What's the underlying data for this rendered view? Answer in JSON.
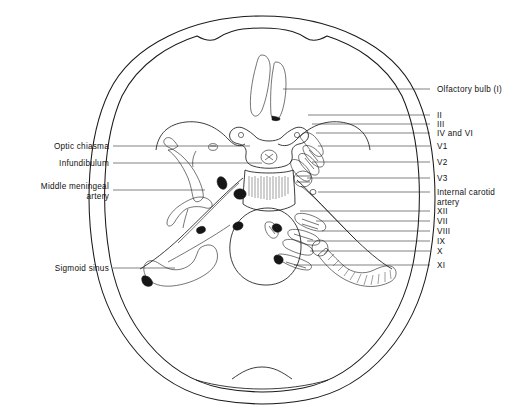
{
  "figure": {
    "view": "superior view of cranial base",
    "background_color": "#ffffff",
    "ink_color": "#1a1a1a",
    "stipple_color": "#8a8a8a"
  },
  "labels_left": [
    {
      "id": "optic-chiasma",
      "text": "Optic chiasma",
      "text2": "",
      "x": 107,
      "y": 146,
      "leader_to_x": 232,
      "leader_to_y": 146
    },
    {
      "id": "infundibulum",
      "text": "Infundibulum",
      "text2": "",
      "x": 107,
      "y": 163,
      "leader_to_x": 255,
      "leader_to_y": 163
    },
    {
      "id": "middle-meningeal-artery",
      "text": "Middle meningeal",
      "text2": "artery",
      "x": 98,
      "y": 190,
      "leader_to_x": 205,
      "leader_to_y": 196
    },
    {
      "id": "sigmoid-sinus",
      "text": "Sigmoid sinus",
      "text2": "",
      "x": 98,
      "y": 268,
      "leader_to_x": 160,
      "leader_to_y": 268
    }
  ],
  "labels_right": [
    {
      "id": "olfactory-bulb",
      "text": "Olfactory bulb (I)",
      "text2": "",
      "x": 437,
      "y": 89,
      "leader_to_x": 283,
      "leader_to_y": 89
    },
    {
      "id": "nerve-II",
      "text": "II",
      "text2": "",
      "x": 437,
      "y": 115,
      "leader_to_x": 308,
      "leader_to_y": 115
    },
    {
      "id": "nerve-III",
      "text": "III",
      "text2": "",
      "x": 437,
      "y": 124,
      "leader_to_x": 312,
      "leader_to_y": 124
    },
    {
      "id": "nerve-IV-VI",
      "text": "IV and VI",
      "text2": "",
      "x": 437,
      "y": 133,
      "leader_to_x": 316,
      "leader_to_y": 133
    },
    {
      "id": "nerve-V1",
      "text": "V1",
      "text2": "",
      "x": 437,
      "y": 146,
      "leader_to_x": 318,
      "leader_to_y": 146
    },
    {
      "id": "nerve-V2",
      "text": "V2",
      "text2": "",
      "x": 437,
      "y": 162,
      "leader_to_x": 312,
      "leader_to_y": 162
    },
    {
      "id": "nerve-V3",
      "text": "V3",
      "text2": "",
      "x": 437,
      "y": 178,
      "leader_to_x": 307,
      "leader_to_y": 178
    },
    {
      "id": "internal-carotid-artery",
      "text": "Internal carotid",
      "text2": "artery",
      "x": 437,
      "y": 192,
      "leader_to_x": 318,
      "leader_to_y": 192
    },
    {
      "id": "nerve-XII",
      "text": "XII",
      "text2": "",
      "x": 437,
      "y": 211,
      "leader_to_x": 300,
      "leader_to_y": 211
    },
    {
      "id": "nerve-VII",
      "text": "VII",
      "text2": "",
      "x": 437,
      "y": 221,
      "leader_to_x": 316,
      "leader_to_y": 221
    },
    {
      "id": "nerve-VIII",
      "text": "VIII",
      "text2": "",
      "x": 437,
      "y": 231,
      "leader_to_x": 322,
      "leader_to_y": 231
    },
    {
      "id": "nerve-IX",
      "text": "IX",
      "text2": "",
      "x": 437,
      "y": 241,
      "leader_to_x": 307,
      "leader_to_y": 241
    },
    {
      "id": "nerve-X",
      "text": "X",
      "text2": "",
      "x": 437,
      "y": 251,
      "leader_to_x": 310,
      "leader_to_y": 251
    },
    {
      "id": "nerve-XI",
      "text": "XI",
      "text2": "",
      "x": 437,
      "y": 265,
      "leader_to_x": 294,
      "leader_to_y": 265
    }
  ]
}
